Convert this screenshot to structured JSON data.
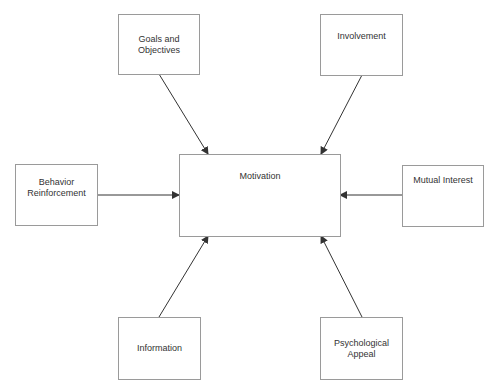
{
  "diagram": {
    "center": {
      "label": "Motivation"
    },
    "nodes": [
      {
        "id": "goals",
        "label": "Goals and\nObjectives"
      },
      {
        "id": "involvement",
        "label": "Involvement"
      },
      {
        "id": "behavior",
        "label": "Behavior\nReinforcement"
      },
      {
        "id": "mutual",
        "label": "Mutual Interest"
      },
      {
        "id": "information",
        "label": "Information"
      },
      {
        "id": "psych",
        "label": "Psychological\nAppeal"
      }
    ],
    "edges": [
      {
        "from": "Goals and Objectives",
        "to": "Motivation"
      },
      {
        "from": "Involvement",
        "to": "Motivation"
      },
      {
        "from": "Behavior Reinforcement",
        "to": "Motivation"
      },
      {
        "from": "Mutual Interest",
        "to": "Motivation"
      },
      {
        "from": "Information",
        "to": "Motivation"
      },
      {
        "from": "Psychological Appeal",
        "to": "Motivation"
      }
    ],
    "colors": {
      "border": "#9a9a9a",
      "arrow": "#333333",
      "text": "#333333"
    }
  }
}
